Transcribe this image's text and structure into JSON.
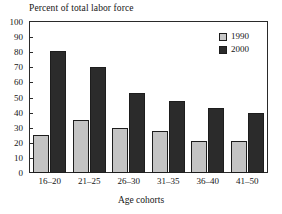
{
  "chart_data": {
    "type": "bar",
    "title": "Percent of total labor force",
    "xlabel": "Age cohorts",
    "ylabel": "",
    "categories": [
      "16–20",
      "21–25",
      "26–30",
      "31–35",
      "36–40",
      "41–50"
    ],
    "series": [
      {
        "name": "1990",
        "color": "#c4c4c4",
        "values": [
          25,
          35,
          30,
          28,
          21,
          21
        ]
      },
      {
        "name": "2000",
        "color": "#2b2b2b",
        "values": [
          81,
          70,
          53,
          48,
          43,
          40
        ]
      }
    ],
    "ylim": [
      0,
      100
    ],
    "yticks": [
      0,
      10,
      20,
      30,
      40,
      50,
      60,
      70,
      80,
      90,
      100
    ],
    "ytick_labels": [
      "0",
      "10",
      "20",
      "30",
      "40",
      "50",
      "60",
      "70",
      "80",
      "90",
      "100"
    ],
    "grid": false,
    "legend_position": "top-right",
    "legend_entries": [
      "1990",
      "2000"
    ]
  }
}
